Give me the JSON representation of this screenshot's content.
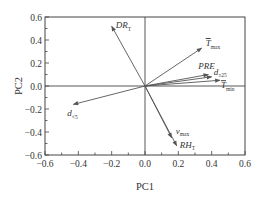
{
  "chart_data": {
    "type": "scatter",
    "subtype": "pca-biplot-loading-vectors",
    "title": "",
    "xlabel": "PC1",
    "ylabel": "PC2",
    "xlim": [
      -0.6,
      0.6
    ],
    "ylim": [
      -0.6,
      0.6
    ],
    "xticks": [
      -0.6,
      -0.4,
      -0.2,
      0.0,
      0.2,
      0.4,
      0.6
    ],
    "yticks": [
      -0.6,
      -0.4,
      -0.2,
      0.0,
      0.2,
      0.4,
      0.6
    ],
    "xtick_labels": [
      "−0.6",
      "−0.4",
      "−0.2",
      "0.0",
      "0.2",
      "0.4",
      "0.6"
    ],
    "ytick_labels": [
      "−0.6",
      "−0.4",
      "−0.2",
      "0.0",
      "0.2",
      "0.4",
      "0.6"
    ],
    "grid": false,
    "zero_lines": true,
    "vectors": [
      {
        "name": "DR_T",
        "base": "DR",
        "sub": "T",
        "pc1": -0.2,
        "pc2": 0.52,
        "label_dx": 4,
        "label_dy": 2
      },
      {
        "name": "T_max",
        "base": "T",
        "sub": "max",
        "overbar": true,
        "pc1": 0.34,
        "pc2": 0.33,
        "label_dx": 4,
        "label_dy": -2
      },
      {
        "name": "PRE",
        "base": "PRE",
        "sub": "",
        "pc1": 0.38,
        "pc2": 0.1,
        "label_dx": -10,
        "label_dy": -6
      },
      {
        "name": "d_≥25",
        "base": "d",
        "sub": "≥25",
        "pc1": 0.4,
        "pc2": 0.08,
        "label_dx": 2,
        "label_dy": -2
      },
      {
        "name": "T_min",
        "base": "T",
        "sub": "min",
        "overbar": true,
        "pc1": 0.45,
        "pc2": 0.05,
        "label_dx": 1,
        "label_dy": 8
      },
      {
        "name": "d_<5",
        "base": "d",
        "sub": "<5",
        "pc1": -0.43,
        "pc2": -0.16,
        "label_dx": -6,
        "label_dy": 12
      },
      {
        "name": "v_max",
        "base": "v",
        "sub": "max",
        "pc1": 0.16,
        "pc2": -0.45,
        "label_dx": 4,
        "label_dy": -4
      },
      {
        "name": "RH_T",
        "base": "RH",
        "sub": "T",
        "pc1": 0.19,
        "pc2": -0.52,
        "label_dx": 3,
        "label_dy": 2
      }
    ]
  },
  "colors": {
    "axes": "#444444",
    "vector": "#555555",
    "text": "#333333"
  }
}
